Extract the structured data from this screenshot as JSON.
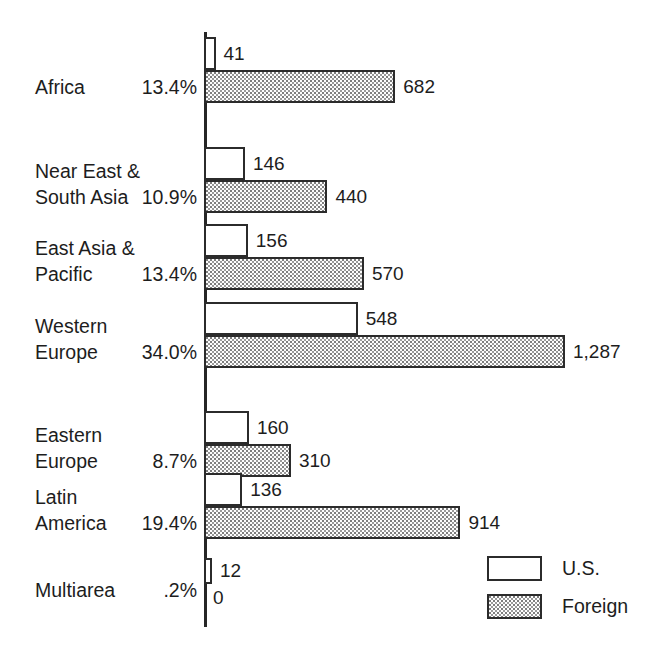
{
  "chart_data": {
    "type": "bar",
    "orientation": "horizontal",
    "title": "",
    "subtitle": "",
    "xlabel": "",
    "ylabel": "",
    "grid": false,
    "axis_ranges": {
      "x": [
        0,
        1287
      ]
    },
    "legend": {
      "position": "bottom-right",
      "entries": [
        {
          "name": "U.S.",
          "fill": "white",
          "label": "U.S."
        },
        {
          "name": "Foreign",
          "fill": "stipple",
          "label": "Foreign"
        }
      ]
    },
    "categories": [
      "Africa",
      "Near East & South Asia",
      "East Asia & Pacific",
      "Western Europe",
      "Eastern Europe",
      "Latin America",
      "Multiarea"
    ],
    "series": [
      {
        "name": "U.S.",
        "values": [
          41,
          146,
          156,
          548,
          160,
          136,
          12
        ]
      },
      {
        "name": "Foreign",
        "values": [
          682,
          440,
          570,
          1287,
          310,
          914,
          0
        ]
      }
    ],
    "percent_annotations": [
      "13.4%",
      "10.9%",
      "13.4%",
      "34.0%",
      "8.7%",
      "19.4%",
      ".2%"
    ]
  },
  "rows": [
    {
      "name_lines": [
        "Africa"
      ],
      "percent": "13.4%",
      "us_value": 41,
      "us_label": "41",
      "foreign_value": 682,
      "foreign_label": "682"
    },
    {
      "name_lines": [
        "Near East &",
        "South Asia"
      ],
      "percent": "10.9%",
      "us_value": 146,
      "us_label": "146",
      "foreign_value": 440,
      "foreign_label": "440"
    },
    {
      "name_lines": [
        "East Asia &",
        "Pacific"
      ],
      "percent": "13.4%",
      "us_value": 156,
      "us_label": "156",
      "foreign_value": 570,
      "foreign_label": "570"
    },
    {
      "name_lines": [
        "Western",
        "Europe"
      ],
      "percent": "34.0%",
      "us_value": 548,
      "us_label": "548",
      "foreign_value": 1287,
      "foreign_label": "1,287"
    },
    {
      "name_lines": [
        "Eastern",
        "Europe"
      ],
      "percent": "8.7%",
      "us_value": 160,
      "us_label": "160",
      "foreign_value": 310,
      "foreign_label": "310"
    },
    {
      "name_lines": [
        "Latin",
        "America"
      ],
      "percent": "19.4%",
      "us_value": 136,
      "us_label": "136",
      "foreign_value": 914,
      "foreign_label": "914"
    },
    {
      "name_lines": [
        "Multiarea"
      ],
      "percent": ".2%",
      "us_value": 12,
      "us_label": "12",
      "foreign_value": 0,
      "foreign_label": "0"
    }
  ],
  "legend": {
    "us_label": "U.S.",
    "foreign_label": "Foreign"
  },
  "colors": {
    "ink": "#2b2b2b",
    "text": "#1d1d1d",
    "background": "#ffffff",
    "stipple": "#8a8a8a"
  },
  "geometry": {
    "axis_x": 204,
    "axis_top": 32,
    "axis_bottom": 627,
    "px_per_unit": 0.2805,
    "row_tops": [
      37,
      147,
      224,
      302,
      411,
      473,
      558
    ],
    "bar_height": 33,
    "bar_height_small": 30
  }
}
